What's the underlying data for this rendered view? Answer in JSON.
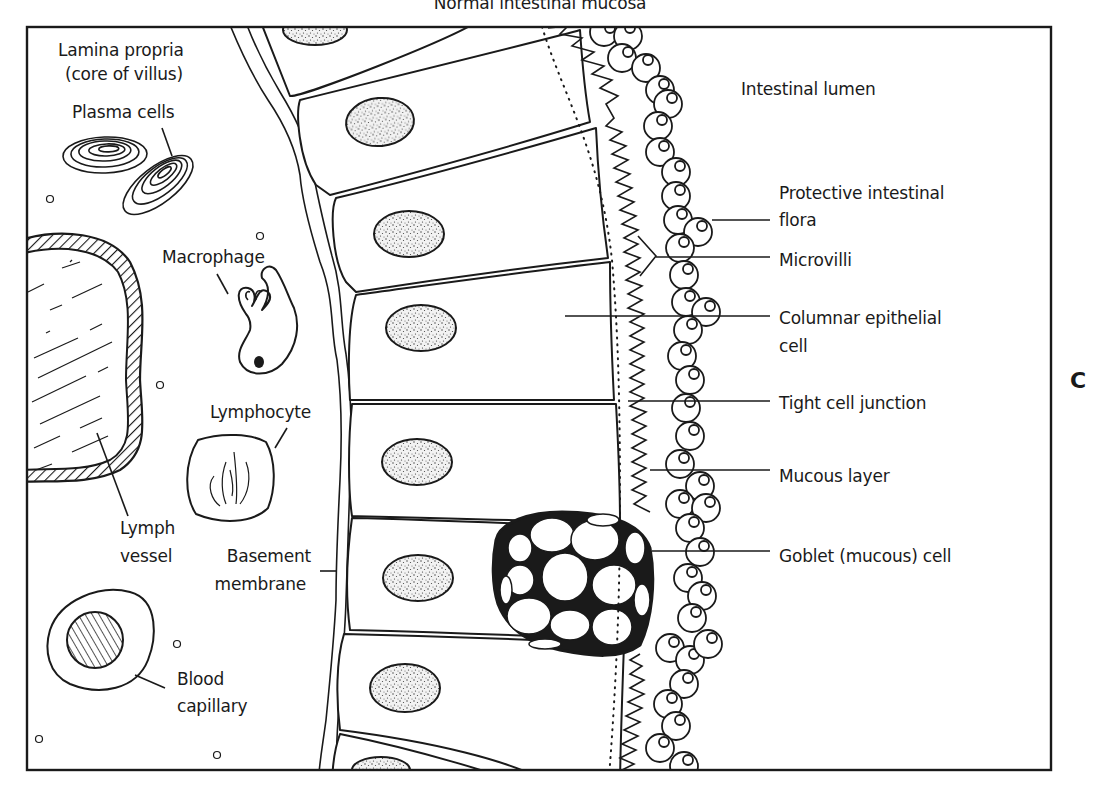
{
  "figure": {
    "title": "Normal intestinal mucosa",
    "panel_letter": "C",
    "colors": {
      "ink": "#1a1a1a",
      "background": "#ffffff"
    }
  },
  "left_labels": {
    "lamina_propria_1": "Lamina propria",
    "lamina_propria_2": "(core of villus)",
    "plasma_cells": "Plasma cells",
    "macrophage": "Macrophage",
    "lymphocyte": "Lymphocyte",
    "lymph_vessel_1": "Lymph",
    "lymph_vessel_2": "vessel",
    "basement_membrane_1": "Basement",
    "basement_membrane_2": "membrane",
    "blood_capillary_1": "Blood",
    "blood_capillary_2": "capillary"
  },
  "right_labels": {
    "intestinal_lumen": "Intestinal lumen",
    "protective_flora_1": "Protective intestinal",
    "protective_flora_2": "flora",
    "microvilli": "Microvilli",
    "columnar_cell_1": "Columnar epithelial",
    "columnar_cell_2": "cell",
    "tight_junction": "Tight cell junction",
    "mucous_layer": "Mucous layer",
    "goblet_cell": "Goblet (mucous) cell"
  }
}
